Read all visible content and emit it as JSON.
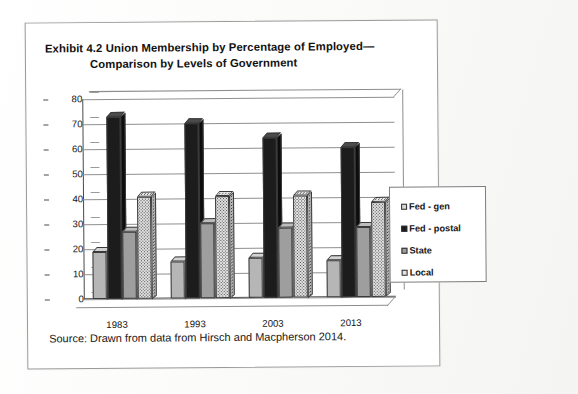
{
  "exhibit": {
    "title_line1": "Exhibit 4.2  Union Membership by Percentage of Employed—",
    "title_line2": "Comparison by Levels of Government",
    "source": "Source: Drawn from data from Hirsch and Macpherson 2014."
  },
  "legend": {
    "items": [
      {
        "label": "Fed - gen",
        "swatch": "light-gray-square"
      },
      {
        "label": "Fed - postal",
        "swatch": "black-square"
      },
      {
        "label": "State",
        "swatch": "medium-gray-square"
      },
      {
        "label": "Local",
        "swatch": "speckled-square"
      }
    ]
  },
  "chart_data": {
    "type": "bar",
    "xlabel": "",
    "ylabel": "",
    "categories": [
      "1983",
      "1993",
      "2003",
      "2013"
    ],
    "ylim": [
      0,
      80
    ],
    "yticks": [
      0,
      10,
      20,
      30,
      40,
      50,
      60,
      70,
      80
    ],
    "grid": true,
    "legend_position": "right",
    "series": [
      {
        "name": "Fed - gen",
        "values": [
          19,
          15,
          16,
          15
        ]
      },
      {
        "name": "Fed - postal",
        "values": [
          73,
          70,
          64,
          60
        ]
      },
      {
        "name": "State",
        "values": [
          27,
          30,
          28,
          28
        ]
      },
      {
        "name": "Local",
        "values": [
          41,
          41,
          41,
          38
        ]
      }
    ]
  }
}
